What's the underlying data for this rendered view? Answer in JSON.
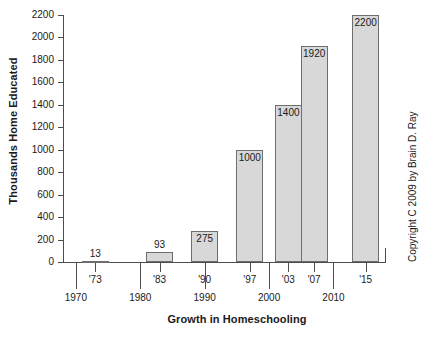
{
  "chart_data": {
    "type": "bar",
    "title": "",
    "xlabel": "Growth in Homeschooling",
    "ylabel": "Thousands Home Educated",
    "categories": [
      "'73",
      "'83",
      "'90",
      "'97",
      "'03",
      "'07",
      "'15"
    ],
    "values": [
      13,
      93,
      275,
      1000,
      1400,
      1920,
      2200
    ],
    "data_labels": [
      "13",
      "93",
      "275",
      "1000",
      "1400",
      "1920",
      "2200"
    ],
    "x_values": [
      1973,
      1983,
      1990,
      1997,
      2003,
      2007,
      2015
    ],
    "ylim": [
      0,
      2200
    ],
    "xlim": [
      1968,
      2018
    ],
    "yticks": [
      0,
      200,
      400,
      600,
      800,
      1000,
      1200,
      1400,
      1600,
      1800,
      2000,
      2200
    ],
    "ytick_labels": [
      "0",
      "200",
      "400",
      "600",
      "800",
      "1000",
      "1200",
      "1400",
      "1600",
      "1800",
      "2000",
      "2200"
    ],
    "xtick_decades": [
      1970,
      1980,
      1990,
      2000,
      2010
    ],
    "xtick_decade_labels": [
      "1970",
      "1980",
      "1990",
      "2000",
      "2010"
    ],
    "grid": false,
    "legend": false,
    "bar_fill_color": "#d8d8d8",
    "bar_edge_color": "#6e6e6e",
    "axis_color": "#4d4d4d"
  },
  "annotations": {
    "copyright": "Copyright C 2009 by Brain D. Ray"
  }
}
